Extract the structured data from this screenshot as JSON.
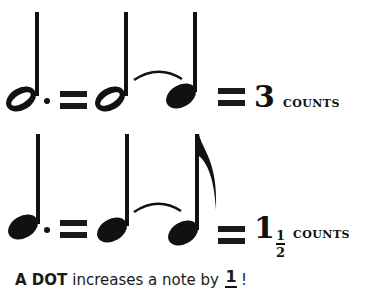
{
  "rows": [
    {
      "id": "dotted-half",
      "lhs_note": "dotted half note",
      "rhs_notes": [
        "half note",
        "quarter note"
      ],
      "tie": true,
      "equals": "=",
      "count_whole": "3",
      "count_fraction": null,
      "count_label": "COUNTS"
    },
    {
      "id": "dotted-quarter",
      "lhs_note": "dotted quarter note",
      "rhs_notes": [
        "quarter note",
        "eighth note"
      ],
      "tie": true,
      "equals": "=",
      "count_whole": "1",
      "count_fraction": {
        "numerator": "1",
        "denominator": "2"
      },
      "count_label": "COUNTS"
    }
  ],
  "caption": {
    "emphasis": "A DOT",
    "text": "increases a note by",
    "fraction_numerator": "1",
    "fraction_denominator_visible": "",
    "ending": "!"
  },
  "colors": {
    "ink": "#111111",
    "background": "#ffffff"
  }
}
